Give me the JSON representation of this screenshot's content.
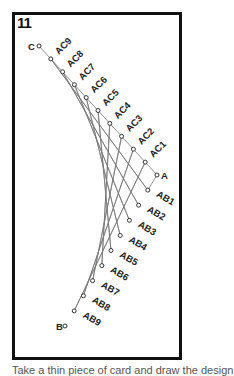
{
  "figure_number": "11",
  "colors": {
    "frame": "#111111",
    "lines": "#777777",
    "text": "#222222"
  },
  "vertices": {
    "A": "A",
    "B": "B",
    "C": "C"
  },
  "ac_points": [
    "AC1",
    "AC2",
    "AC3",
    "AC4",
    "AC5",
    "AC6",
    "AC7",
    "AC8",
    "AC9"
  ],
  "ab_points": [
    "AB1",
    "AB2",
    "AB3",
    "AB4",
    "AB5",
    "AB6",
    "AB7",
    "AB8",
    "AB9"
  ],
  "caption": "Take a thin piece of card and draw the design"
}
